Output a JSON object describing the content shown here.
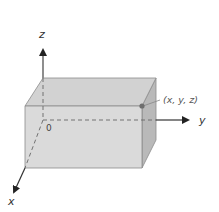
{
  "diagram": {
    "type": "3d-coordinate-box",
    "labels": {
      "z_axis": "z",
      "y_axis": "y",
      "x_axis": "x",
      "origin": "0",
      "point": "(x, y, z)"
    },
    "colors": {
      "front_face": "#d9d9d9",
      "top_face": "#d4d4d4",
      "side_face": "#b8b8b8",
      "edge": "#8c8c8c",
      "axis": "#333333",
      "point": "#6e6e6e"
    }
  }
}
